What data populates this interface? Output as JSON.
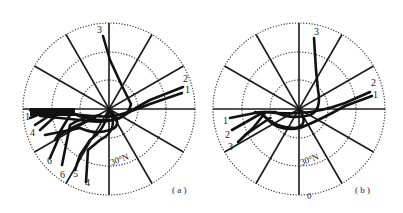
{
  "figure": {
    "panels": [
      {
        "id": "a",
        "label": "( a )",
        "latitude_label": "30°N",
        "center": [
          109,
          109
        ],
        "radii": [
          29,
          57,
          86
        ],
        "track_labels": [
          {
            "text": "3",
            "x": 97,
            "y": 33
          },
          {
            "text": "2",
            "x": 183,
            "y": 82
          },
          {
            "text": "1",
            "x": 185,
            "y": 93
          },
          {
            "text": "1",
            "x": 25,
            "y": 120
          },
          {
            "text": "4",
            "x": 30,
            "y": 136
          },
          {
            "text": "6",
            "x": 47,
            "y": 164
          },
          {
            "text": "6",
            "x": 60,
            "y": 178
          },
          {
            "text": "5",
            "x": 73,
            "y": 177
          },
          {
            "text": "4",
            "x": 85,
            "y": 186
          }
        ]
      },
      {
        "id": "b",
        "label": "( b )",
        "latitude_label": "30°N",
        "bottom_label": "0",
        "center": [
          299,
          109
        ],
        "radii": [
          29,
          57,
          86
        ],
        "track_labels": [
          {
            "text": "3",
            "x": 314,
            "y": 35
          },
          {
            "text": "2",
            "x": 371,
            "y": 86
          },
          {
            "text": "1",
            "x": 373,
            "y": 98
          },
          {
            "text": "1",
            "x": 223,
            "y": 124
          },
          {
            "text": "2",
            "x": 225,
            "y": 138
          },
          {
            "text": "3",
            "x": 228,
            "y": 150
          }
        ]
      }
    ]
  }
}
